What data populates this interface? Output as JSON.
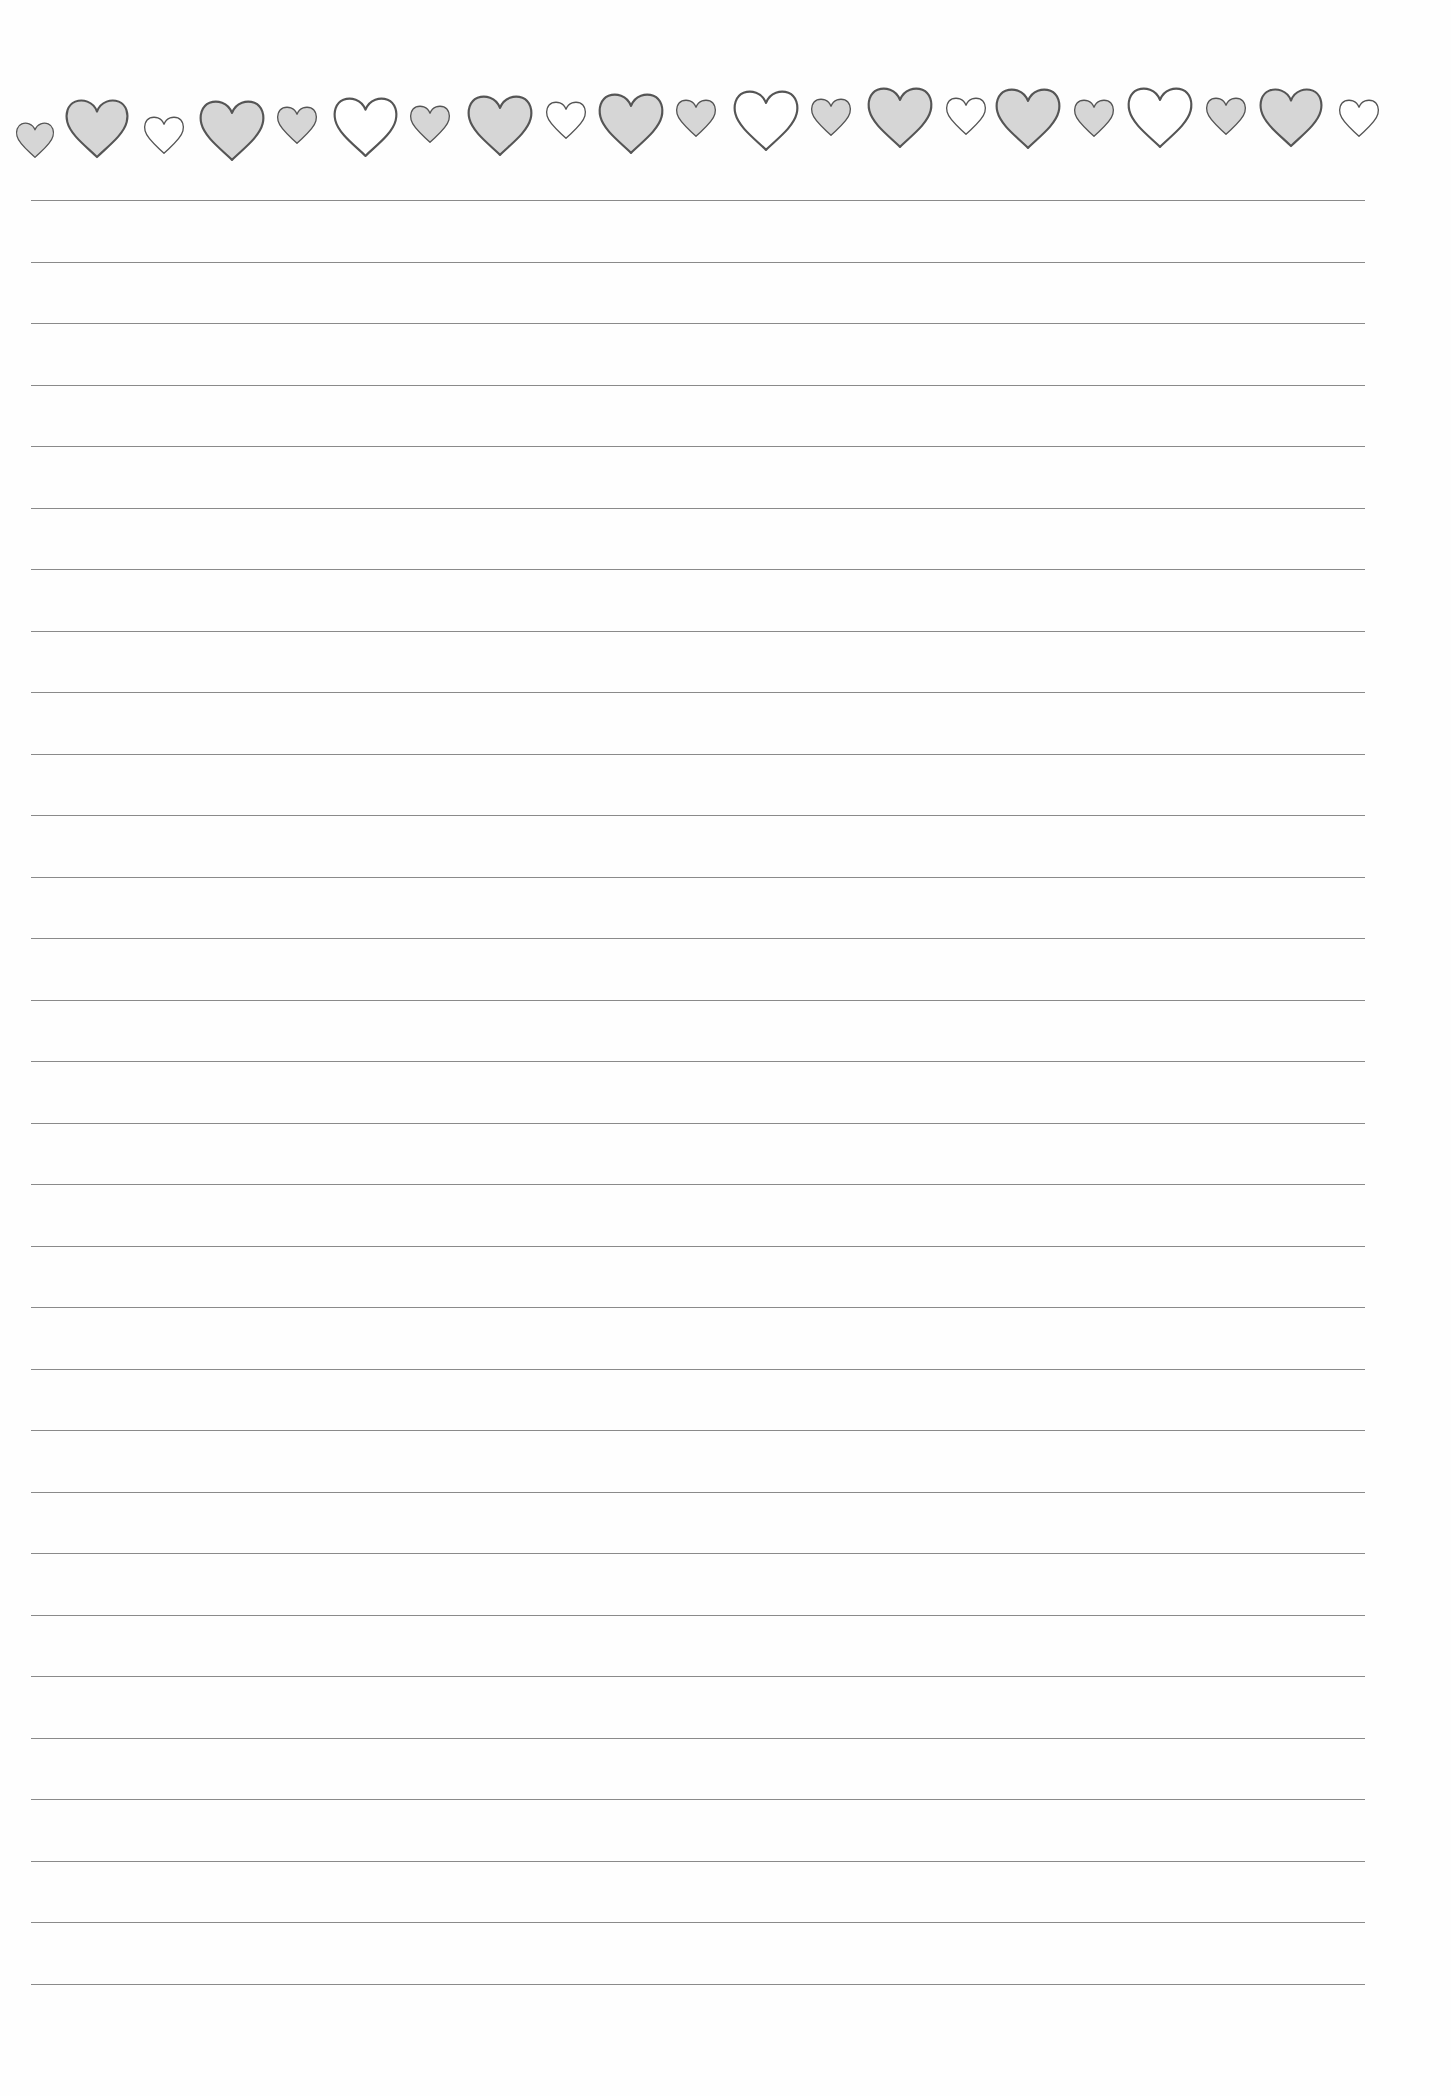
{
  "page": {
    "type": "lined-writing-paper",
    "colors": {
      "background": "#fefefe",
      "line": "#8a8a8a",
      "heart_outline": "#555555",
      "heart_fill_gray": "#d6d6d6",
      "heart_fill_white": "#ffffff"
    }
  },
  "heart_border": {
    "hearts": [
      {
        "cx": 35,
        "cy": 140,
        "size": 40,
        "fill": "gray"
      },
      {
        "cx": 97,
        "cy": 128,
        "size": 66,
        "fill": "gray"
      },
      {
        "cx": 164,
        "cy": 135,
        "size": 42,
        "fill": "white"
      },
      {
        "cx": 232,
        "cy": 130,
        "size": 68,
        "fill": "gray"
      },
      {
        "cx": 297,
        "cy": 125,
        "size": 42,
        "fill": "gray"
      },
      {
        "cx": 365,
        "cy": 127,
        "size": 67,
        "fill": "white"
      },
      {
        "cx": 430,
        "cy": 124,
        "size": 42,
        "fill": "gray"
      },
      {
        "cx": 500,
        "cy": 125,
        "size": 68,
        "fill": "gray"
      },
      {
        "cx": 566,
        "cy": 120,
        "size": 42,
        "fill": "white"
      },
      {
        "cx": 631,
        "cy": 123,
        "size": 68,
        "fill": "gray"
      },
      {
        "cx": 696,
        "cy": 118,
        "size": 42,
        "fill": "gray"
      },
      {
        "cx": 766,
        "cy": 120,
        "size": 68,
        "fill": "white"
      },
      {
        "cx": 831,
        "cy": 117,
        "size": 42,
        "fill": "gray"
      },
      {
        "cx": 900,
        "cy": 117,
        "size": 68,
        "fill": "gray"
      },
      {
        "cx": 966,
        "cy": 116,
        "size": 42,
        "fill": "white"
      },
      {
        "cx": 1028,
        "cy": 118,
        "size": 68,
        "fill": "gray"
      },
      {
        "cx": 1094,
        "cy": 118,
        "size": 42,
        "fill": "gray"
      },
      {
        "cx": 1160,
        "cy": 117,
        "size": 68,
        "fill": "white"
      },
      {
        "cx": 1226,
        "cy": 116,
        "size": 42,
        "fill": "gray"
      },
      {
        "cx": 1291,
        "cy": 117,
        "size": 66,
        "fill": "gray"
      },
      {
        "cx": 1359,
        "cy": 118,
        "size": 42,
        "fill": "white"
      }
    ]
  },
  "lines": {
    "count": 30,
    "first_y": 200,
    "spacing": 61.5,
    "left": 31,
    "width": 1334
  }
}
